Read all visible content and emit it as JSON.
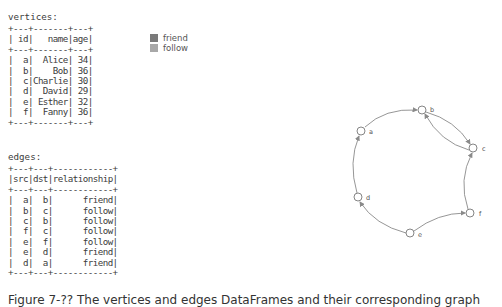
{
  "vertices": {
    "label": "vertices:",
    "columns": [
      "id",
      "name",
      "age"
    ],
    "rows": [
      [
        "a",
        "Alice",
        "34"
      ],
      [
        "b",
        "Bob",
        "36"
      ],
      [
        "c",
        "Charlie",
        "30"
      ],
      [
        "d",
        "David",
        "29"
      ],
      [
        "e",
        "Esther",
        "32"
      ],
      [
        "f",
        "Fanny",
        "36"
      ]
    ],
    "ascii": "+---+-------+---+\n| id|   name|age|\n+---+-------+---+\n|  a|  Alice| 34|\n|  b|    Bob| 36|\n|  c|Charlie| 30|\n|  d|  David| 29|\n|  e| Esther| 32|\n|  f|  Fanny| 36|\n+---+-------+---+"
  },
  "edges": {
    "label": "edges:",
    "columns": [
      "src",
      "dst",
      "relationship"
    ],
    "rows": [
      [
        "a",
        "b",
        "friend"
      ],
      [
        "b",
        "c",
        "follow"
      ],
      [
        "c",
        "b",
        "follow"
      ],
      [
        "f",
        "c",
        "follow"
      ],
      [
        "e",
        "f",
        "follow"
      ],
      [
        "e",
        "d",
        "friend"
      ],
      [
        "d",
        "a",
        "friend"
      ]
    ],
    "ascii": "+---+---+------------+\n|src|dst|relationship|\n+---+---+------------+\n|  a|  b|      friend|\n|  b|  c|      follow|\n|  c|  b|      follow|\n|  f|  c|      follow|\n|  e|  f|      follow|\n|  e|  d|      friend|\n|  d|  a|      friend|\n+---+---+------------+"
  },
  "legend": {
    "items": [
      {
        "label": "friend",
        "color": "#7a7a7a"
      },
      {
        "label": "follow",
        "color": "#a8a8a8"
      }
    ]
  },
  "graph": {
    "nodes": [
      {
        "id": "a",
        "x": 361,
        "y": 131
      },
      {
        "id": "b",
        "x": 422,
        "y": 110
      },
      {
        "id": "c",
        "x": 473,
        "y": 148
      },
      {
        "id": "d",
        "x": 358,
        "y": 197
      },
      {
        "id": "e",
        "x": 410,
        "y": 233
      },
      {
        "id": "f",
        "x": 470,
        "y": 213
      }
    ],
    "edge_color": "#8a8a8a"
  },
  "caption": "Figure 7-?? The vertices and edges DataFrames and their corresponding graph"
}
